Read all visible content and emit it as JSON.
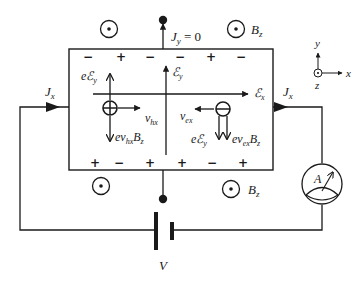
{
  "diagram": {
    "labels": {
      "jy": "J",
      "jy_sub": "y",
      "jy_eq": " = 0",
      "jx_left": "J",
      "jx_left_sub": "x",
      "jx_right": "J",
      "jx_right_sub": "x",
      "bz_top": "B",
      "bz_top_sub": "z",
      "bz_bottom": "B",
      "bz_bottom_sub": "z",
      "ey_field": "ℰ",
      "ey_field_sub": "y",
      "ex_field": "ℰ",
      "ex_field_sub": "x",
      "hole_force_e": "eℰ",
      "hole_force_e_sub": "y",
      "hole_lorentz": "ev",
      "hole_lorentz_sub": "hx",
      "hole_lorentz_b": "B",
      "hole_lorentz_b_sub": "z",
      "hole_velocity": "v",
      "hole_velocity_sub": "hx",
      "electron_velocity": "v",
      "electron_velocity_sub": "ex",
      "electron_force_e": "eℰ",
      "electron_force_e_sub": "y",
      "electron_lorentz": "ev",
      "electron_lorentz_sub": "ex",
      "electron_lorentz_b": "B",
      "electron_lorentz_b_sub": "z",
      "battery": "V",
      "ammeter": "A",
      "axis_x": "x",
      "axis_y": "y",
      "axis_z": "z"
    },
    "top_signs": [
      "−",
      "+",
      "−",
      "−",
      "+",
      "−"
    ],
    "bottom_signs": [
      "+",
      "−",
      "+",
      "+",
      "−",
      "+"
    ],
    "magnetic_field_symbols": [
      "dot-out-of-page",
      "dot-out-of-page",
      "dot-out-of-page",
      "dot-out-of-page"
    ],
    "carriers": [
      {
        "type": "hole",
        "symbol": "⊕"
      },
      {
        "type": "electron",
        "symbol": "⊖"
      }
    ],
    "colors": {
      "ink": "#1a1a1a",
      "background": "#ffffff"
    }
  }
}
